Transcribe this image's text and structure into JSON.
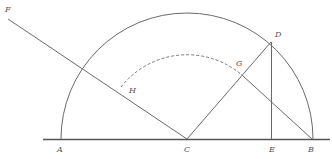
{
  "diagram": {
    "type": "geometric-construction",
    "colors": {
      "line": "#6a6a6a",
      "baseline": "#555555",
      "label": "#555555",
      "background": "#ffffff"
    },
    "points": {
      "A": {
        "label": "A",
        "x": 61,
        "y": 139
      },
      "C": {
        "label": "C",
        "x": 187,
        "y": 139
      },
      "E": {
        "label": "E",
        "x": 272,
        "y": 139
      },
      "B": {
        "label": "B",
        "x": 312,
        "y": 139
      },
      "D": {
        "label": "D",
        "x": 271,
        "y": 42
      },
      "G": {
        "label": "G",
        "x": 243,
        "y": 76
      },
      "H": {
        "label": "H",
        "x": 120,
        "y": 88
      },
      "F": {
        "label": "F",
        "x": 8,
        "y": 20
      }
    },
    "labels": {
      "A": "A",
      "B": "B",
      "C": "C",
      "D": "D",
      "E": "E",
      "F": "F",
      "G": "G",
      "H": "H"
    },
    "elements": [
      "baseline AB extended",
      "semicircle centered C radius CA",
      "dashed arc centered C through H and G",
      "line F to C",
      "line C to D",
      "line D to E (perpendicular)",
      "line G to B"
    ]
  }
}
